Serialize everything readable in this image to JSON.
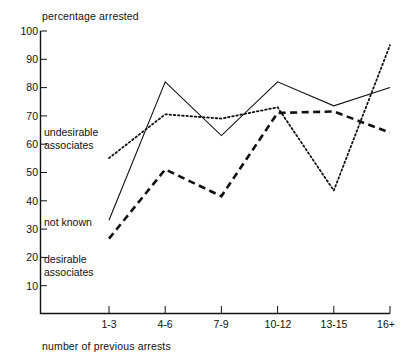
{
  "chart_data": {
    "type": "line",
    "title": "",
    "xlabel": "number of previous arrests",
    "ylabel": "percentage arrested",
    "categories": [
      "1-3",
      "4-6",
      "7-9",
      "10-12",
      "13-15",
      "16+"
    ],
    "ylim": [
      0,
      100
    ],
    "yticks": [
      10,
      20,
      30,
      40,
      50,
      60,
      70,
      80,
      90,
      100
    ],
    "grid": false,
    "legend_position": "inline-annotations",
    "series": [
      {
        "name": "undesirable associates",
        "style": "dotted",
        "color": "#111111",
        "values": [
          55,
          70.5,
          69,
          73,
          43.5,
          95
        ]
      },
      {
        "name": "not known",
        "style": "solid",
        "color": "#111111",
        "values": [
          33,
          82,
          63,
          82,
          73.5,
          80
        ]
      },
      {
        "name": "desirable associates",
        "style": "dashed",
        "color": "#111111",
        "values": [
          26.5,
          51,
          41.5,
          71,
          71.5,
          64
        ]
      }
    ],
    "annotations": [
      {
        "text_line1": "undesirable",
        "text_line2": "associates",
        "series": "undesirable associates"
      },
      {
        "text_line1": "not known",
        "text_line2": "",
        "series": "not known"
      },
      {
        "text_line1": "desirable",
        "text_line2": "associates",
        "series": "desirable associates"
      }
    ]
  },
  "ytick_labels": [
    "100",
    "90",
    "80",
    "70",
    "60",
    "50",
    "40",
    "30",
    "20",
    "10"
  ],
  "xtick_labels": [
    "1-3",
    "4-6",
    "7-9",
    "10-12",
    "13-15",
    "16+"
  ],
  "labels": {
    "ylabel": "percentage arrested",
    "xlabel": "number of previous arrests",
    "undesirable_l1": "undesirable",
    "undesirable_l2": "associates",
    "notknown_l1": "not known",
    "desirable_l1": "desirable",
    "desirable_l2": "associates"
  }
}
